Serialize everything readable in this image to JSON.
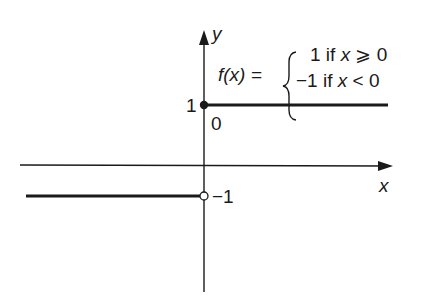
{
  "diagram": {
    "function_label": "f(x) =",
    "cases": [
      {
        "value": "1",
        "condition": "if",
        "var": "x",
        "relation": "⩾ 0"
      },
      {
        "value": "−1",
        "condition": "if",
        "var": "x",
        "relation": "< 0"
      }
    ],
    "axes": {
      "x_label": "x",
      "y_label": "y"
    },
    "ticks": {
      "origin": "0",
      "y_one": "1",
      "y_minus_one": "−1"
    },
    "segments": [
      {
        "from_x": "0",
        "to_x": "+∞",
        "y": 1,
        "left_endpoint": "closed"
      },
      {
        "from_x": "-∞",
        "to_x": "0",
        "y": -1,
        "right_endpoint": "open"
      }
    ],
    "colors": {
      "line": "#1a1a1a",
      "background": "#ffffff"
    }
  }
}
